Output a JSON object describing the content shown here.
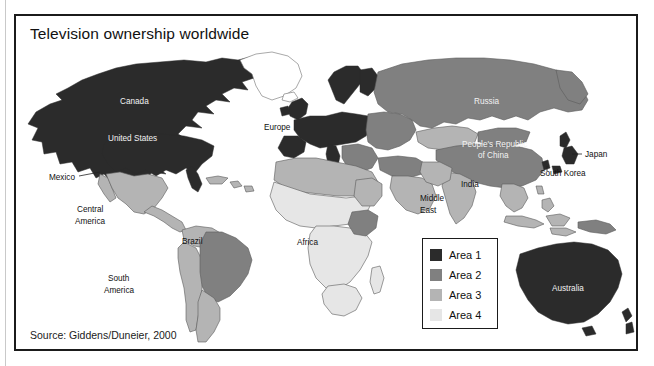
{
  "figure": {
    "title": "Television ownership worldwide",
    "source": "Source: Giddens/Duneier, 2000"
  },
  "legend": {
    "items": [
      {
        "label": "Area 1",
        "color": "#2b2b2b"
      },
      {
        "label": "Area 2",
        "color": "#808080"
      },
      {
        "label": "Area 3",
        "color": "#b4b4b4"
      },
      {
        "label": "Area 4",
        "color": "#e6e6e6"
      }
    ]
  },
  "map": {
    "ocean_color": "#ffffff",
    "outline_color": "#5a5a5a",
    "labels": [
      {
        "name": "canada",
        "text": "Canada",
        "x": 104,
        "y": 88,
        "style": "on-dark"
      },
      {
        "name": "united-states",
        "text": "United States",
        "x": 92,
        "y": 125,
        "style": "on-dark"
      },
      {
        "name": "mexico",
        "text": "Mexico",
        "x": 33,
        "y": 164,
        "style": "dark"
      },
      {
        "name": "central-america-1",
        "text": "Central",
        "x": 61,
        "y": 196,
        "style": "dark"
      },
      {
        "name": "central-america-2",
        "text": "America",
        "x": 59,
        "y": 208,
        "style": "dark"
      },
      {
        "name": "brazil",
        "text": "Brazil",
        "x": 166,
        "y": 228,
        "style": "dark"
      },
      {
        "name": "south-america-1",
        "text": "South",
        "x": 92,
        "y": 265,
        "style": "dark"
      },
      {
        "name": "south-america-2",
        "text": "America",
        "x": 88,
        "y": 277,
        "style": "dark"
      },
      {
        "name": "europe",
        "text": "Europe",
        "x": 248,
        "y": 114,
        "style": "dark"
      },
      {
        "name": "africa",
        "text": "Africa",
        "x": 281,
        "y": 229,
        "style": "dark"
      },
      {
        "name": "middle-east-1",
        "text": "Middle",
        "x": 404,
        "y": 185,
        "style": "dark"
      },
      {
        "name": "middle-east-2",
        "text": "East",
        "x": 404,
        "y": 197,
        "style": "dark"
      },
      {
        "name": "russia",
        "text": "Russia",
        "x": 458,
        "y": 88,
        "style": "on-dark"
      },
      {
        "name": "china-1",
        "text": "People's Republic",
        "x": 452,
        "y": 131,
        "style": "on-dark"
      },
      {
        "name": "china-2",
        "text": "of China",
        "x": 466,
        "y": 142,
        "style": "on-dark"
      },
      {
        "name": "india",
        "text": "India",
        "x": 445,
        "y": 171,
        "style": "dark"
      },
      {
        "name": "japan",
        "text": "Japan",
        "x": 569,
        "y": 137,
        "style": "dark"
      },
      {
        "name": "south-korea",
        "text": "South Korea",
        "x": 531,
        "y": 156,
        "style": "dark"
      },
      {
        "name": "australia",
        "text": "Australia",
        "x": 550,
        "y": 275,
        "style": "on-dark"
      }
    ]
  }
}
